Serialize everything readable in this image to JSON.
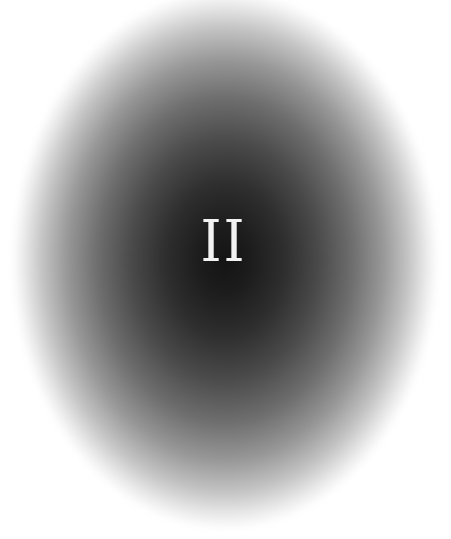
{
  "image": {
    "numeral": "II",
    "colors": {
      "background": "#ffffff",
      "oval_center": "#141414",
      "oval_edge": "#ffffff",
      "numeral": "#f2f2f2"
    }
  }
}
